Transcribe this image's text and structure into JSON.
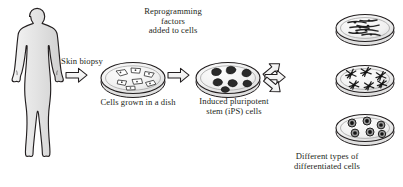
{
  "figure": {
    "type": "scientific-process-diagram",
    "colors": {
      "outline": "#231f20",
      "body_fill": "#e3e3e3",
      "dish_fill": "#efefef",
      "cell_dark": "#2b2b2b",
      "background": "#ffffff"
    }
  },
  "labels": {
    "skin_biopsy": "Skin biopsy",
    "reprogramming_factors": "Reprogramming\nfactors\nadded to cells",
    "cells_grown": "Cells grown in a dish",
    "ips_cells": "Induced pluripotent\nstem (iPS) cells",
    "specific_conditions": "Specific culture conditions\nfor different cell types",
    "differentiated": "Different types of\ndifferentiated cells"
  },
  "stages": [
    {
      "id": "human-body",
      "name": "human-figure",
      "caption": ""
    },
    {
      "id": "dish-fibroblasts",
      "name": "petri-dish-skin-cells",
      "caption": "Cells grown in a dish",
      "cell_shape": "angular-fibroblast"
    },
    {
      "id": "dish-ips",
      "name": "petri-dish-ips-colonies",
      "caption": "Induced pluripotent stem (iPS) cells",
      "cell_shape": "round-dark-colony"
    },
    {
      "id": "dish-elongated",
      "name": "petri-dish-elongated-cells",
      "caption": "",
      "cell_shape": "spindle-elongated"
    },
    {
      "id": "dish-star",
      "name": "petri-dish-star-cells",
      "caption": "",
      "cell_shape": "star-neuron"
    },
    {
      "id": "dish-round",
      "name": "petri-dish-round-cells",
      "caption": "",
      "cell_shape": "round-nucleated"
    }
  ],
  "arrows": [
    {
      "name": "arrow-biopsy",
      "direction": "right"
    },
    {
      "name": "arrow-reprogramming",
      "direction": "right"
    },
    {
      "name": "arrow-differentiate-up",
      "direction": "up-right"
    },
    {
      "name": "arrow-differentiate-straight",
      "direction": "right"
    },
    {
      "name": "arrow-differentiate-down",
      "direction": "down-right"
    }
  ]
}
